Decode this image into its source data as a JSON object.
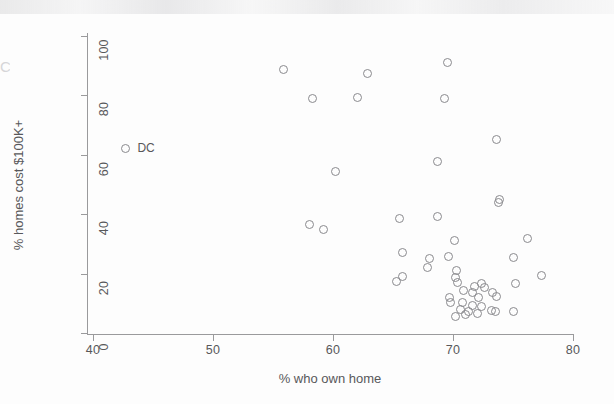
{
  "chart_data": {
    "type": "scatter",
    "title": "",
    "xlabel": "% who own home",
    "ylabel": "% homes cost $100K+",
    "xlim": [
      40,
      80
    ],
    "ylim": [
      0,
      100
    ],
    "xticks": [
      40,
      50,
      60,
      70,
      80
    ],
    "yticks": [
      0,
      20,
      40,
      60,
      80,
      100
    ],
    "grid": false,
    "legend": "none",
    "marker": "open-circle",
    "marker_color": "#8a8a8e",
    "series": [
      {
        "name": "states",
        "points": [
          {
            "x": 42.7,
            "y": 62.0,
            "label": "DC"
          },
          {
            "x": 55.9,
            "y": 88.8,
            "label": ""
          },
          {
            "x": 58.3,
            "y": 78.8,
            "label": ""
          },
          {
            "x": 62.0,
            "y": 79.3,
            "label": ""
          },
          {
            "x": 62.9,
            "y": 87.3,
            "label": ""
          },
          {
            "x": 69.5,
            "y": 91.2,
            "label": ""
          },
          {
            "x": 69.3,
            "y": 79.0,
            "label": ""
          },
          {
            "x": 73.6,
            "y": 65.2,
            "label": ""
          },
          {
            "x": 68.7,
            "y": 57.8,
            "label": ""
          },
          {
            "x": 60.2,
            "y": 54.3,
            "label": ""
          },
          {
            "x": 73.9,
            "y": 44.9,
            "label": ""
          },
          {
            "x": 73.8,
            "y": 43.8,
            "label": ""
          },
          {
            "x": 65.5,
            "y": 38.7,
            "label": ""
          },
          {
            "x": 68.7,
            "y": 39.1,
            "label": ""
          },
          {
            "x": 58.0,
            "y": 36.7,
            "label": ""
          },
          {
            "x": 59.2,
            "y": 34.7,
            "label": ""
          },
          {
            "x": 76.2,
            "y": 31.9,
            "label": ""
          },
          {
            "x": 70.1,
            "y": 31.2,
            "label": ""
          },
          {
            "x": 65.8,
            "y": 27.2,
            "label": ""
          },
          {
            "x": 69.6,
            "y": 25.9,
            "label": ""
          },
          {
            "x": 68.0,
            "y": 25.2,
            "label": ""
          },
          {
            "x": 75.0,
            "y": 25.5,
            "label": ""
          },
          {
            "x": 67.9,
            "y": 22.2,
            "label": ""
          },
          {
            "x": 70.3,
            "y": 21.2,
            "label": ""
          },
          {
            "x": 77.4,
            "y": 19.3,
            "label": ""
          },
          {
            "x": 65.8,
            "y": 19.0,
            "label": ""
          },
          {
            "x": 65.3,
            "y": 17.3,
            "label": ""
          },
          {
            "x": 70.2,
            "y": 18.6,
            "label": ""
          },
          {
            "x": 70.4,
            "y": 17.1,
            "label": ""
          },
          {
            "x": 75.2,
            "y": 16.6,
            "label": ""
          },
          {
            "x": 72.4,
            "y": 16.8,
            "label": ""
          },
          {
            "x": 71.8,
            "y": 15.6,
            "label": ""
          },
          {
            "x": 72.6,
            "y": 15.2,
            "label": ""
          },
          {
            "x": 70.9,
            "y": 14.4,
            "label": ""
          },
          {
            "x": 71.6,
            "y": 13.6,
            "label": ""
          },
          {
            "x": 73.3,
            "y": 13.7,
            "label": ""
          },
          {
            "x": 73.6,
            "y": 12.3,
            "label": ""
          },
          {
            "x": 72.1,
            "y": 12.0,
            "label": ""
          },
          {
            "x": 69.7,
            "y": 11.9,
            "label": ""
          },
          {
            "x": 69.8,
            "y": 10.4,
            "label": ""
          },
          {
            "x": 70.8,
            "y": 10.2,
            "label": ""
          },
          {
            "x": 71.6,
            "y": 9.4,
            "label": ""
          },
          {
            "x": 72.4,
            "y": 9.0,
            "label": ""
          },
          {
            "x": 70.6,
            "y": 7.9,
            "label": ""
          },
          {
            "x": 71.3,
            "y": 7.3,
            "label": ""
          },
          {
            "x": 73.2,
            "y": 7.6,
            "label": ""
          },
          {
            "x": 73.5,
            "y": 7.1,
            "label": ""
          },
          {
            "x": 75.0,
            "y": 7.4,
            "label": ""
          },
          {
            "x": 70.2,
            "y": 5.4,
            "label": ""
          },
          {
            "x": 72.0,
            "y": 6.6,
            "label": ""
          },
          {
            "x": 71.0,
            "y": 6.2,
            "label": ""
          }
        ]
      }
    ]
  },
  "axes": {
    "ylabel": "% homes cost $100K+",
    "xlabel": "% who own home",
    "xticklabels": [
      "40",
      "50",
      "60",
      "70",
      "80"
    ],
    "yticklabels": [
      "0",
      "20",
      "40",
      "60",
      "80",
      "100"
    ]
  },
  "annotations": [
    {
      "text": "DC",
      "x": 42.7,
      "y": 62.0
    }
  ],
  "artifacts": {
    "left_edge_ghost": "C"
  }
}
